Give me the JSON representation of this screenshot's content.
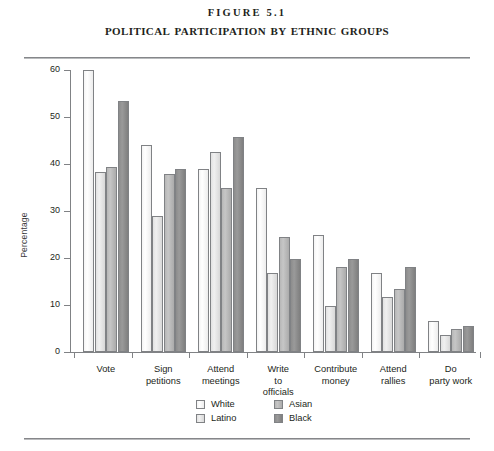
{
  "figure": {
    "number_label": "FIGURE 5.1",
    "title": "POLITICAL PARTICIPATION BY ETHNIC GROUPS"
  },
  "chart_data": {
    "type": "bar",
    "title": "Political Participation by Ethnic Groups",
    "subtitle": "Figure 5.1",
    "xlabel": "",
    "ylabel": "Percentage",
    "ylim": [
      0,
      60
    ],
    "yticks": [
      0,
      10,
      20,
      30,
      40,
      50,
      60
    ],
    "grid": false,
    "legend_position": "bottom-center",
    "categories": [
      "Vote",
      "Sign petitions",
      "Attend meetings",
      "Write to officials",
      "Contribute money",
      "Attend rallies",
      "Do party work"
    ],
    "category_lines": [
      [
        "Vote"
      ],
      [
        "Sign",
        "petitions"
      ],
      [
        "Attend",
        "meetings"
      ],
      [
        "Write",
        "to",
        "officials"
      ],
      [
        "Contribute",
        "money"
      ],
      [
        "Attend",
        "rallies"
      ],
      [
        "Do",
        "party work"
      ]
    ],
    "series": [
      {
        "name": "White",
        "color": "#f7f7f7",
        "values": [
          60.0,
          44.0,
          39.0,
          35.0,
          24.8,
          16.8,
          6.6
        ]
      },
      {
        "name": "Latino",
        "color": "#e8e8e8",
        "values": [
          38.3,
          29.0,
          42.5,
          16.8,
          9.7,
          11.8,
          3.6
        ]
      },
      {
        "name": "Asian",
        "color": "#bdbdbd",
        "values": [
          39.3,
          37.8,
          35.0,
          24.5,
          18.0,
          13.5,
          5.0
        ]
      },
      {
        "name": "Black",
        "color": "#8f8f8f",
        "values": [
          53.5,
          39.0,
          45.7,
          19.8,
          19.7,
          18.0,
          5.5
        ]
      }
    ]
  },
  "legend": {
    "entries": [
      {
        "label": "White",
        "swatch": "sw-white"
      },
      {
        "label": "Asian",
        "swatch": "sw-asian"
      },
      {
        "label": "Latino",
        "swatch": "sw-latino"
      },
      {
        "label": "Black",
        "swatch": "sw-black"
      }
    ]
  }
}
